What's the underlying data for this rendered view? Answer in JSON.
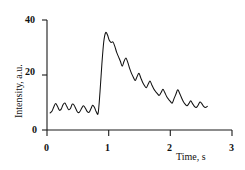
{
  "chart_data": {
    "type": "line",
    "title": "",
    "subtitle": "",
    "xlabel": "Time, s",
    "ylabel": "Intensity, a.u.",
    "xlim": [
      0,
      3
    ],
    "ylim": [
      0,
      40
    ],
    "xticks": [
      "0",
      "1",
      "2",
      "3"
    ],
    "xtick_values": [
      0,
      1,
      2,
      3
    ],
    "yticks": [
      "0",
      "20",
      "40"
    ],
    "ytick_values": [
      0,
      20,
      40
    ],
    "grid": false,
    "legend": null,
    "legend_position": "none",
    "annotations": [],
    "series": [
      {
        "name": "Intensity",
        "color": "#111111",
        "x": [
          0.05,
          0.08,
          0.11,
          0.14,
          0.17,
          0.2,
          0.23,
          0.26,
          0.29,
          0.32,
          0.35,
          0.38,
          0.41,
          0.44,
          0.47,
          0.5,
          0.53,
          0.56,
          0.59,
          0.62,
          0.65,
          0.68,
          0.71,
          0.74,
          0.77,
          0.8,
          0.83,
          0.86,
          0.89,
          0.92,
          0.95,
          0.98,
          1.01,
          1.04,
          1.07,
          1.1,
          1.13,
          1.16,
          1.19,
          1.22,
          1.25,
          1.28,
          1.31,
          1.34,
          1.37,
          1.4,
          1.43,
          1.46,
          1.49,
          1.52,
          1.55,
          1.58,
          1.61,
          1.64,
          1.67,
          1.7,
          1.73,
          1.76,
          1.79,
          1.82,
          1.85,
          1.88,
          1.91,
          1.94,
          1.97,
          2.0,
          2.03,
          2.06,
          2.09,
          2.12,
          2.15,
          2.18,
          2.21,
          2.24,
          2.27,
          2.3,
          2.33,
          2.36,
          2.39,
          2.42,
          2.45,
          2.48,
          2.51,
          2.54,
          2.57,
          2.6
        ],
        "y": [
          6.2,
          6.8,
          8.4,
          9.6,
          8.6,
          7.2,
          7.6,
          9.2,
          9.8,
          8.6,
          7.4,
          7.8,
          9.4,
          9.0,
          7.6,
          6.4,
          6.6,
          7.8,
          8.8,
          8.0,
          6.8,
          6.4,
          7.6,
          9.0,
          8.2,
          6.6,
          6.2,
          14.0,
          24.0,
          32.0,
          35.4,
          34.6,
          32.6,
          31.8,
          32.0,
          30.4,
          28.2,
          26.6,
          25.0,
          23.2,
          25.0,
          26.2,
          24.6,
          22.4,
          20.6,
          19.2,
          18.0,
          19.4,
          20.6,
          19.0,
          17.4,
          16.2,
          15.4,
          16.6,
          17.8,
          16.4,
          15.0,
          14.0,
          13.2,
          12.6,
          13.6,
          14.8,
          13.6,
          12.2,
          11.2,
          10.4,
          9.8,
          11.4,
          13.0,
          14.6,
          13.4,
          11.8,
          10.4,
          9.4,
          8.8,
          9.6,
          10.6,
          9.6,
          8.6,
          8.2,
          9.0,
          10.2,
          9.6,
          8.6,
          8.2,
          8.6
        ]
      }
    ]
  },
  "axes": {
    "y_title": "Intensity, a.u.",
    "x_title": "Time, s",
    "y_ticks": {
      "t0": "0",
      "t20": "20",
      "t40": "40"
    },
    "x_ticks": {
      "t0": "0",
      "t1": "1",
      "t2": "2",
      "t3": "3"
    }
  }
}
